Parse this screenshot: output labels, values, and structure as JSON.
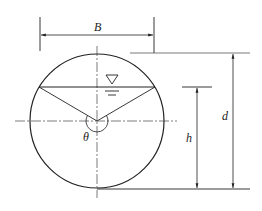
{
  "diagram": {
    "type": "partially filled circular pipe cross-section",
    "labels": {
      "width": "B",
      "diameter": "d",
      "depth": "h",
      "angle": "θ"
    },
    "colors": {
      "stroke": "#222222",
      "background": "#ffffff"
    }
  }
}
